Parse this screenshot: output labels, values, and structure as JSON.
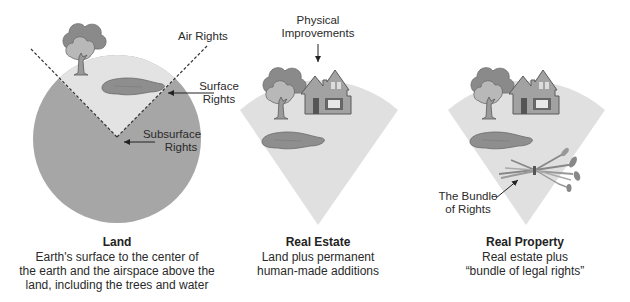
{
  "colors": {
    "earth": "#a6a6a6",
    "sky_wedge": "#e3e3e3",
    "fan": "#e0e0e0",
    "water": "#8e8e8e",
    "tree_dark": "#8a8a8a",
    "tree_light": "#b8b8b8",
    "house": "#a2a2a2",
    "outline": "#5a5a5a"
  },
  "panels": [
    {
      "id": "land",
      "title": "Land",
      "description_lines": [
        "Earth's surface to the center of",
        "the earth and the airspace above the",
        "land, including the trees and water"
      ],
      "callouts": [
        {
          "lines": [
            "Air Rights"
          ]
        },
        {
          "lines": [
            "Surface",
            "Rights"
          ]
        },
        {
          "lines": [
            "Subsurface",
            "Rights"
          ]
        }
      ]
    },
    {
      "id": "real-estate",
      "title": "Real Estate",
      "description_lines": [
        "Land plus permanent",
        "human-made additions"
      ],
      "callouts": [
        {
          "lines": [
            "Physical",
            "Improvements"
          ]
        }
      ]
    },
    {
      "id": "real-property",
      "title": "Real Property",
      "description_lines": [
        "Real estate plus",
        "“bundle of legal rights”"
      ],
      "callouts": [
        {
          "lines": [
            "The Bundle",
            "of Rights"
          ]
        }
      ]
    }
  ]
}
